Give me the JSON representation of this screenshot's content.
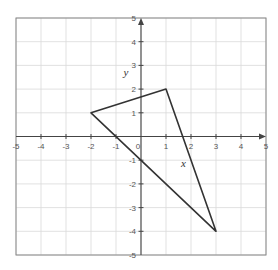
{
  "diagram": {
    "type": "coordinate-plane",
    "x_range": [
      -5,
      5
    ],
    "y_range": [
      -5,
      5
    ],
    "x_ticks": [
      "-5",
      "-4",
      "-3",
      "-2",
      "-1",
      "0",
      "1",
      "2",
      "3",
      "4",
      "5"
    ],
    "y_ticks": [
      "-5",
      "-4",
      "-3",
      "-2",
      "-1",
      "1",
      "2",
      "3",
      "4",
      "5"
    ],
    "grid": true,
    "triangle": {
      "vertices": [
        [
          -2,
          1
        ],
        [
          1,
          2
        ],
        [
          3,
          -4
        ]
      ],
      "stroke": "#333333"
    },
    "side_labels": [
      {
        "text": "y",
        "x": -0.6,
        "y": 2.55
      },
      {
        "text": "x",
        "x": 1.7,
        "y": -1.3
      }
    ],
    "colors": {
      "grid": "#d9d9d9",
      "frame": "#888888",
      "axis": "#444444",
      "shape": "#333333"
    }
  }
}
